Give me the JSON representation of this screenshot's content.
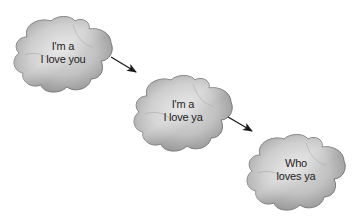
{
  "diagram": {
    "type": "flow",
    "nodes": [
      {
        "id": "cloud-1",
        "lines": [
          "I'm a",
          "I love you"
        ]
      },
      {
        "id": "cloud-2",
        "lines": [
          "I'm a",
          "I love ya"
        ]
      },
      {
        "id": "cloud-3",
        "lines": [
          "Who",
          "loves ya"
        ]
      }
    ],
    "edges": [
      {
        "from": "cloud-1",
        "to": "cloud-2"
      },
      {
        "from": "cloud-2",
        "to": "cloud-3"
      }
    ],
    "colors": {
      "cloud_fill_light": "#d4d4d4",
      "cloud_fill_dark": "#9a9a9a",
      "cloud_outline": "#7a7a7a",
      "arrow": "#1a1a1a",
      "text": "#1e1e1e",
      "background": "#ffffff"
    }
  }
}
